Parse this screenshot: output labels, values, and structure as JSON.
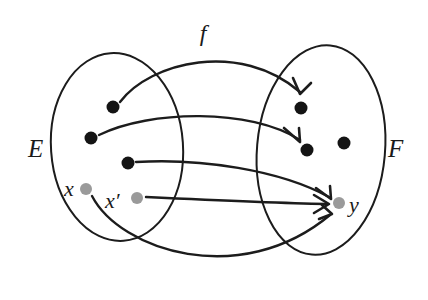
{
  "figure": {
    "background_color": "#ffffff",
    "stroke_color": "#1c1c1c",
    "black_point_color": "#141414",
    "gray_point_color": "#9a9a9a"
  },
  "labels": {
    "map": "f",
    "domain_set": "E",
    "codomain_set": "F",
    "point_x": "x",
    "point_x_prime": "x′",
    "point_y": "y"
  },
  "sets": [
    {
      "name": "E",
      "label": "E",
      "label_x": 28,
      "label_y": 157,
      "ellipse": {
        "cx": 117,
        "cy": 147,
        "rx": 66,
        "ry": 94,
        "rotate": -4
      }
    },
    {
      "name": "F",
      "label": "F",
      "label_x": 388,
      "label_y": 157,
      "ellipse": {
        "cx": 321,
        "cy": 150,
        "rx": 64,
        "ry": 105,
        "rotate": 5
      }
    }
  ],
  "points": [
    {
      "id": "e1",
      "set": "E",
      "color": "black",
      "cx": 113,
      "cy": 107,
      "r": 6.5,
      "label": ""
    },
    {
      "id": "e2",
      "set": "E",
      "color": "black",
      "cx": 91,
      "cy": 138,
      "r": 6.5,
      "label": ""
    },
    {
      "id": "e3",
      "set": "E",
      "color": "black",
      "cx": 128,
      "cy": 163,
      "r": 6.5,
      "label": ""
    },
    {
      "id": "x",
      "set": "E",
      "color": "gray",
      "cx": 86,
      "cy": 189,
      "r": 6.0,
      "label": "x",
      "label_x": 64,
      "label_y": 196
    },
    {
      "id": "xp",
      "set": "E",
      "color": "gray",
      "cx": 137,
      "cy": 198,
      "r": 6.0,
      "label": "x′",
      "label_x": 105,
      "label_y": 208
    },
    {
      "id": "f1",
      "set": "F",
      "color": "black",
      "cx": 301,
      "cy": 108,
      "r": 6.5,
      "label": ""
    },
    {
      "id": "f2",
      "set": "F",
      "color": "black",
      "cx": 307,
      "cy": 150,
      "r": 6.5,
      "label": ""
    },
    {
      "id": "f3",
      "set": "F",
      "color": "black",
      "cx": 344,
      "cy": 143,
      "r": 6.5,
      "label": ""
    },
    {
      "id": "y",
      "set": "F",
      "color": "gray",
      "cx": 339,
      "cy": 203,
      "r": 6.0,
      "label": "y",
      "label_x": 349,
      "label_y": 212
    }
  ],
  "map_label_position": {
    "x": 203,
    "y": 41
  },
  "arrows": [
    {
      "name": "arrow-e1-to-f1",
      "from": "e1",
      "to": "f1",
      "path": "M 120 102 C 150 62 240 40 300 92",
      "head": "M 293 78 L 300 94 L 311 83"
    },
    {
      "name": "arrow-e2-to-f2",
      "from": "e2",
      "to": "f2",
      "path": "M 99 135 C 150 110 250 108 300 140",
      "head": "M 284 128 L 300 142 L 299 128"
    },
    {
      "name": "arrow-e3-to-y",
      "from": "e3",
      "to": "y",
      "path": "M 136 162 C 200 158 280 170 329 197",
      "head": "M 316 188 L 331 199 L 330 186"
    },
    {
      "name": "arrow-xprime-to-y",
      "from": "xp",
      "to": "y",
      "path": "M 146 197 C 210 200 275 203 326 204",
      "head": "M 314 195 L 329 204 L 314 213"
    },
    {
      "name": "arrow-x-to-y",
      "from": "x",
      "to": "y",
      "path": "M 92 196 C 120 250 240 290 330 215",
      "head": "M 322 205 L 332 214 L 319 219"
    }
  ],
  "counts": {
    "points_in_E": 5,
    "points_in_F": 4,
    "arrows": 5
  }
}
